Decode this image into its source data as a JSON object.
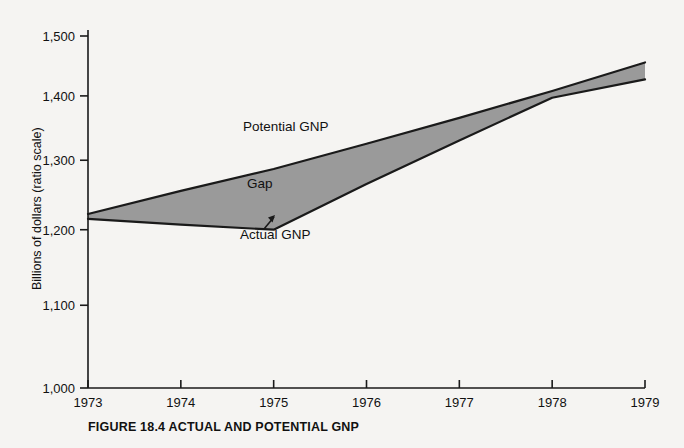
{
  "caption": "FIGURE 18.4 ACTUAL AND POTENTIAL GNP",
  "axis": {
    "y_title": "Billions of dollars (ratio scale)",
    "x_title": ""
  },
  "labels": {
    "potential": "Potential GNP",
    "actual": "Actual GNP",
    "gap": "Gap"
  },
  "colors": {
    "background": "#f5f4f2",
    "gap_fill": "#9a9a9a",
    "line": "#1a1a1a",
    "axis": "#1a1a1a",
    "text": "#111111"
  },
  "chart_data": {
    "type": "area",
    "title": "FIGURE 18.4 ACTUAL AND POTENTIAL GNP",
    "xlabel": "",
    "ylabel": "Billions of dollars (ratio scale)",
    "yscale": "log",
    "ylim": [
      1000,
      1500
    ],
    "xlim": [
      1973,
      1979
    ],
    "grid": false,
    "legend": "inline-annotations",
    "x": [
      1973,
      1974,
      1975,
      1976,
      1977,
      1978,
      1979
    ],
    "ytick_labels": [
      "1,000",
      "1,100",
      "1,200",
      "1,300",
      "1,400",
      "1,500"
    ],
    "ytick_values": [
      1000,
      1100,
      1200,
      1300,
      1400,
      1500
    ],
    "xtick_labels": [
      "1973",
      "1974",
      "1975",
      "1976",
      "1977",
      "1978",
      "1979"
    ],
    "series": [
      {
        "name": "Potential GNP",
        "values": [
          1222,
          1255,
          1287,
          1325,
          1365,
          1408,
          1455
        ]
      },
      {
        "name": "Actual GNP",
        "values": [
          1215,
          1207,
          1200,
          1265,
          1330,
          1397,
          1427
        ]
      }
    ],
    "annotations": [
      {
        "text": "Potential GNP",
        "x": 1974.7,
        "y": 1340
      },
      {
        "text": "Gap",
        "x": 1974.8,
        "y": 1248
      },
      {
        "text": "Actual GNP",
        "x": 1975.1,
        "y": 1176,
        "arrow_to": {
          "x": 1975,
          "y": 1200
        }
      }
    ]
  }
}
